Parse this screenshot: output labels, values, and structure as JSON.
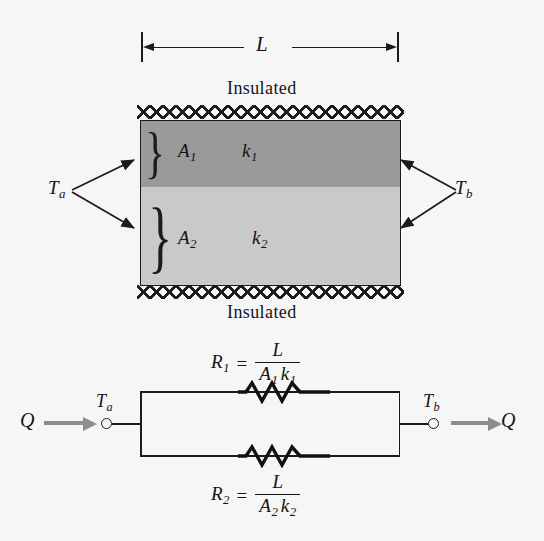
{
  "figure": {
    "type": "thermal-resistance-parallel-diagram",
    "dimension": {
      "length_label": "L"
    },
    "slab": {
      "insulation_top_label": "Insulated",
      "insulation_bottom_label": "Insulated",
      "upper_layer": {
        "area_label": "A",
        "area_subscript": "1",
        "conductivity_label": "k",
        "conductivity_subscript": "1",
        "fill_color": "#9a9a9a"
      },
      "lower_layer": {
        "area_label": "A",
        "area_subscript": "2",
        "conductivity_label": "k",
        "conductivity_subscript": "2",
        "fill_color": "#c9c9c9"
      },
      "left_temperature": "T",
      "left_temperature_subscript": "a",
      "right_temperature": "T",
      "right_temperature_subscript": "b"
    },
    "circuit": {
      "heat_flow_in_label": "Q",
      "heat_flow_out_label": "Q",
      "node_left_label": "T",
      "node_left_subscript": "a",
      "node_right_label": "T",
      "node_right_subscript": "b",
      "resistor_top": {
        "name": "R",
        "subscript": "1",
        "equals": "=",
        "numerator": "L",
        "denominator_a": "A",
        "denominator_a_sub": "1",
        "denominator_k": "k",
        "denominator_k_sub": "1"
      },
      "resistor_bottom": {
        "name": "R",
        "subscript": "2",
        "equals": "=",
        "numerator": "L",
        "denominator_a": "A",
        "denominator_a_sub": "2",
        "denominator_k": "k",
        "denominator_k_sub": "2"
      },
      "arrow_color": "#8d8d8d"
    },
    "colors": {
      "background": "#f6f6f6",
      "ink": "#1b1b1b"
    }
  }
}
